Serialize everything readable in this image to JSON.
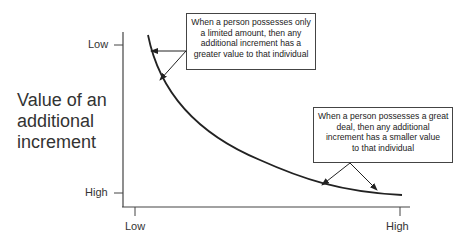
{
  "y_axis": {
    "label_lines": [
      "Value of an",
      "additional",
      "increment"
    ],
    "ticks": [
      {
        "label": "Low",
        "position": "top"
      },
      {
        "label": "High",
        "position": "bottom"
      }
    ]
  },
  "x_axis": {
    "label": "",
    "ticks": [
      {
        "label": "Low",
        "position": "left"
      },
      {
        "label": "High",
        "position": "right"
      }
    ]
  },
  "callouts": [
    {
      "id": "limited-amount",
      "lines": [
        "When a person possesses only",
        "a limited amount, then any",
        "additional increment has a",
        "greater value to that individual"
      ]
    },
    {
      "id": "great-deal",
      "lines": [
        "When a person possesses a great",
        "deal, then any additional",
        "increment has a smaller value",
        "to that individual"
      ]
    }
  ],
  "curve": {
    "description": "Diminishing marginal value curve, decreasing and convex",
    "color": "#222222"
  },
  "colors": {
    "line": "#333333",
    "text": "#222222",
    "background": "#ffffff"
  }
}
